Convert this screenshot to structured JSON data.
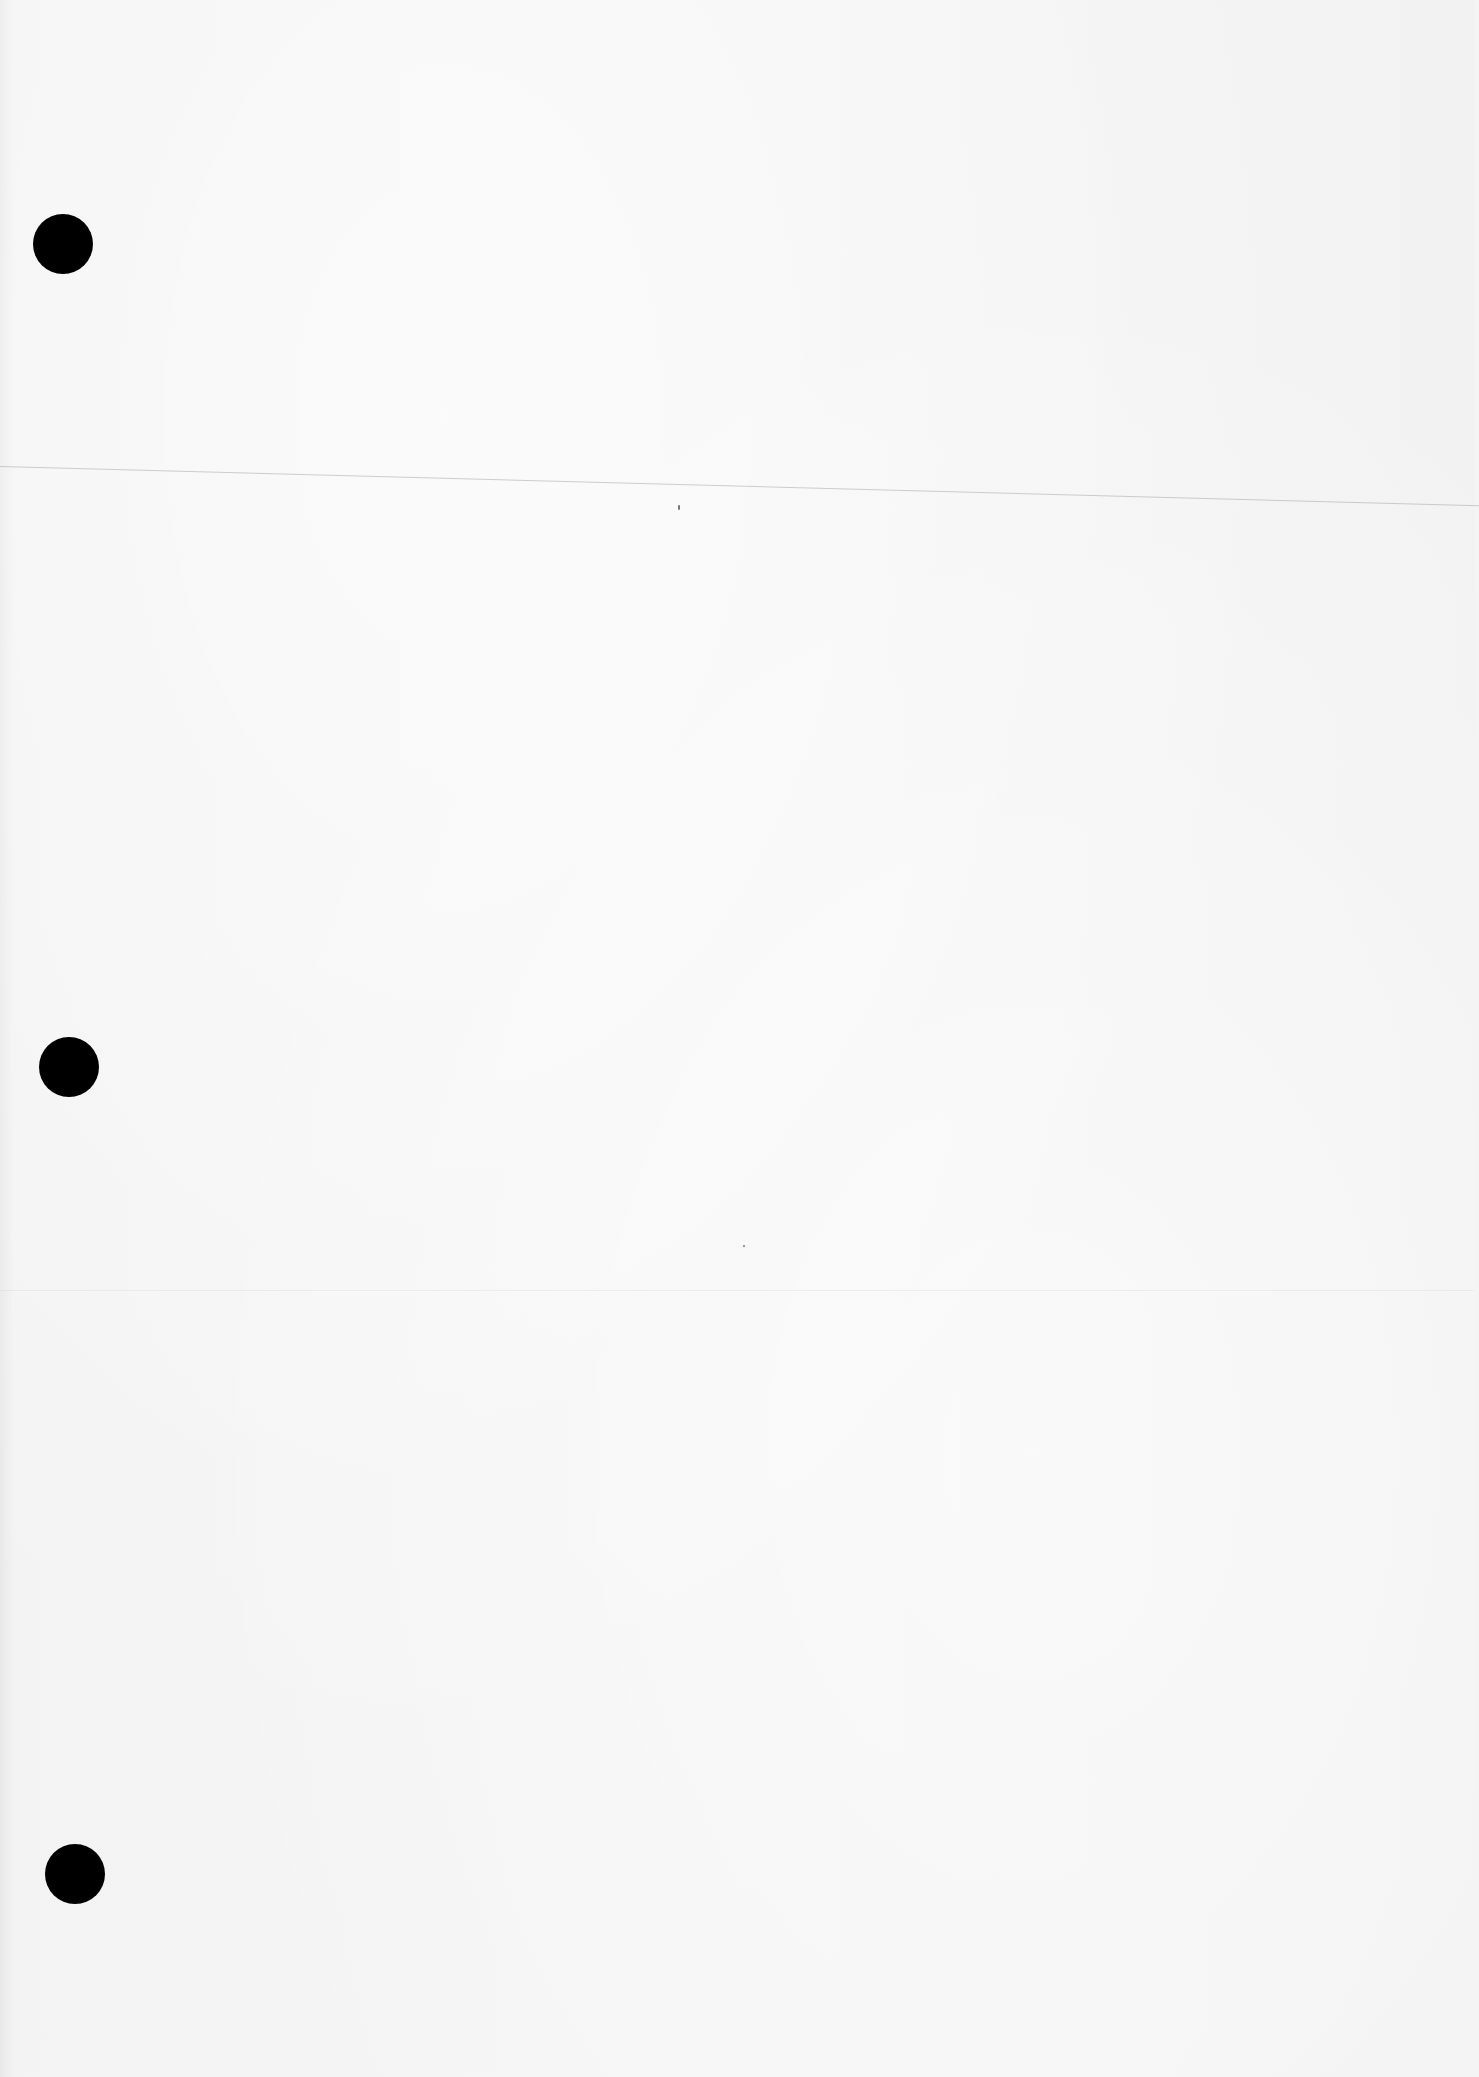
{
  "document": {
    "type": "blank-scanned-page",
    "background_color": "#f4f4f4",
    "text_content": "",
    "punch_holes": [
      {
        "cx": 63,
        "cy": 244,
        "r": 30,
        "color": "#000000"
      },
      {
        "cx": 69,
        "cy": 1067,
        "r": 30,
        "color": "#000000"
      },
      {
        "cx": 75,
        "cy": 1874,
        "r": 30,
        "color": "#000000"
      }
    ],
    "fold_line": {
      "x1": 0,
      "y1": 466,
      "x2": 1474,
      "y2": 505
    },
    "specks": [
      {
        "x": 678,
        "y": 507
      },
      {
        "x": 743,
        "y": 1245
      }
    ]
  }
}
